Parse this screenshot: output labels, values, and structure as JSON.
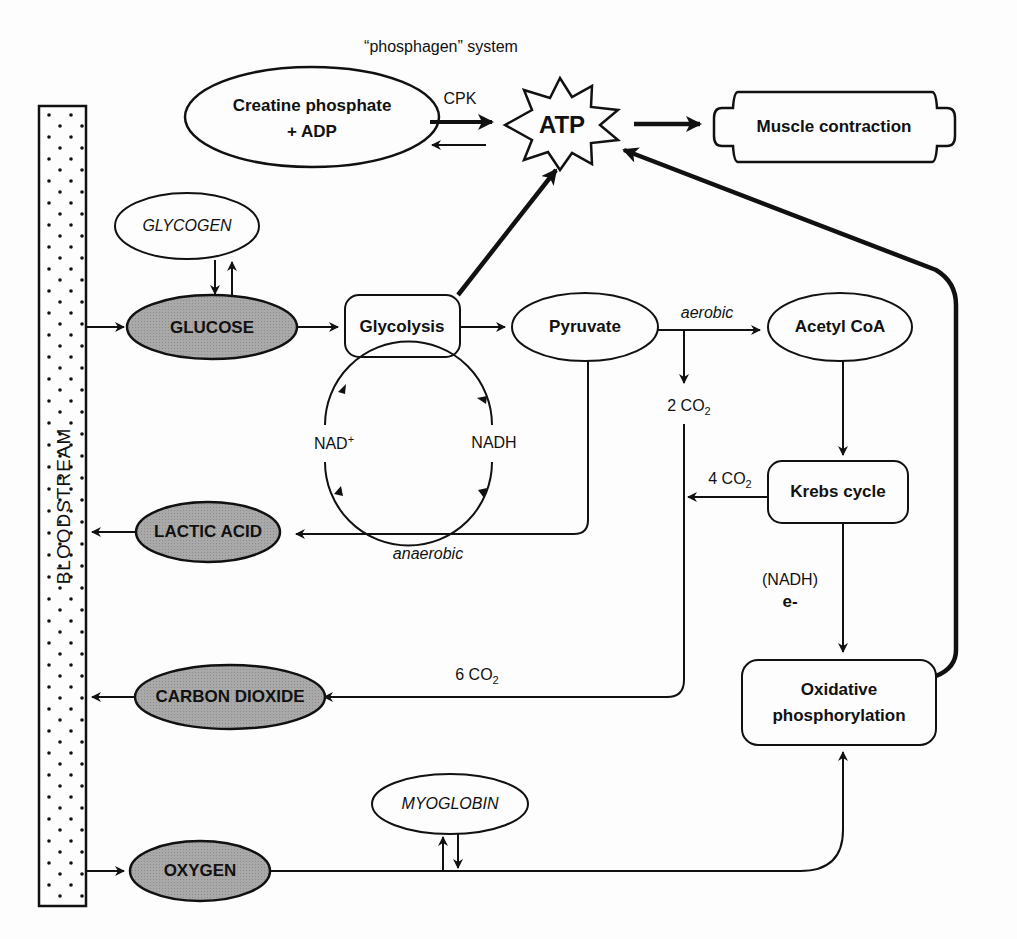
{
  "diagram": {
    "system_label": "“phosphagen” system",
    "bloodstream": "BLOODSTREAM",
    "nodes": {
      "creatine_line1": "Creatine phosphate",
      "creatine_line2": "+ ADP",
      "atp": "ATP",
      "muscle": "Muscle contraction",
      "glycogen": "GLYCOGEN",
      "glucose": "GLUCOSE",
      "glycolysis": "Glycolysis",
      "pyruvate": "Pyruvate",
      "acetyl": "Acetyl CoA",
      "krebs": "Krebs cycle",
      "oxphos_line1": "Oxidative",
      "oxphos_line2": "phosphorylation",
      "lactic": "LACTIC ACID",
      "co2": "CARBON DIOXIDE",
      "oxygen": "OXYGEN",
      "myoglobin": "MYOGLOBIN"
    },
    "edge_labels": {
      "cpk": "CPK",
      "aerobic": "aerobic",
      "anaerobic": "anaerobic",
      "nad_plus": "NAD",
      "nad_plus_sup": "+",
      "nadh": "NADH",
      "co2_2": "2 CO",
      "co2_4": "4 CO",
      "co2_6": "6 CO",
      "co2_sub": "2",
      "nadh_paren": "(NADH)",
      "electron": "e-"
    },
    "colors": {
      "line": "#111111",
      "shaded_fill": "#a8a8a8",
      "background": "#fdfdfd"
    }
  }
}
